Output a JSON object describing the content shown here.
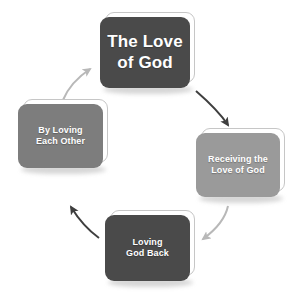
{
  "diagram": {
    "type": "cycle",
    "background_color": "#ffffff",
    "nodes": [
      {
        "id": "love-of-god",
        "label": "The Love\nof God",
        "line1": "The Love",
        "line2": "of God",
        "fill_color": "#4a4a4a",
        "text_color": "#ffffff",
        "position": "top"
      },
      {
        "id": "receiving",
        "label": "Receiving the\nLove of God",
        "line1": "Receiving the",
        "line2": "Love of God",
        "fill_color": "#9a9a9a",
        "text_color": "#ffffff",
        "position": "right"
      },
      {
        "id": "loving-back",
        "label": "Loving\nGod Back",
        "line1": "Loving",
        "line2": "God Back",
        "fill_color": "#4a4a4a",
        "text_color": "#ffffff",
        "position": "bottom"
      },
      {
        "id": "by-loving",
        "label": "By Loving\nEach Other",
        "line1": "By Loving",
        "line2": "Each Other",
        "fill_color": "#7d7d7d",
        "text_color": "#ffffff",
        "position": "left"
      }
    ],
    "arrows": [
      {
        "id": "arrow-top-to-right",
        "from": "love-of-god",
        "to": "receiving",
        "color": "#3f3f3f"
      },
      {
        "id": "arrow-right-to-bottom",
        "from": "receiving",
        "to": "loving-back",
        "color": "#b8b8b8"
      },
      {
        "id": "arrow-bottom-to-left",
        "from": "loving-back",
        "to": "by-loving",
        "color": "#3f3f3f"
      },
      {
        "id": "arrow-left-to-top",
        "from": "by-loving",
        "to": "love-of-god",
        "color": "#b8b8b8"
      }
    ]
  }
}
